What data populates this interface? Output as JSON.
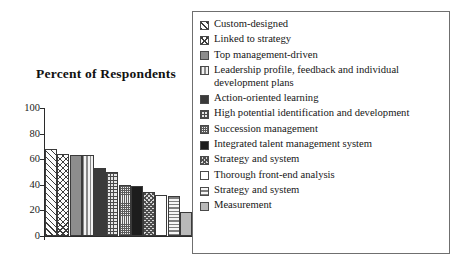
{
  "chart_data": {
    "type": "bar",
    "title": "Percent of Respondents",
    "xlabel": "",
    "ylabel": "",
    "ylim": [
      0,
      100
    ],
    "ytick_labels": [
      "100",
      "80",
      "60",
      "40",
      "20",
      "0"
    ],
    "ytick_values": [
      100,
      80,
      60,
      40,
      20,
      0
    ],
    "grid": false,
    "legend_position": "right",
    "categories": [
      "Custom-designed",
      "Linked to strategy",
      "Top management-driven",
      "Leadership profile, feedback and individual development plans",
      "Action-oriented learning",
      "High potential identification and development",
      "Succession management",
      "Integrated talent management system",
      "Strategy and system",
      "Thorough front-end analysis",
      "Strategy and system",
      "Measurement"
    ],
    "values": [
      68,
      64,
      63,
      63,
      53,
      50,
      40,
      39,
      34,
      32,
      31,
      19
    ],
    "bars": [
      {
        "label": "Custom-designed",
        "value": 68,
        "pattern": "diagonal-hatch"
      },
      {
        "label": "Linked to strategy",
        "value": 64,
        "pattern": "cross-hatch"
      },
      {
        "label": "Top management-driven",
        "value": 63,
        "pattern": "solid-gray"
      },
      {
        "label": "Leadership profile, feedback and individual development plans",
        "value": 63,
        "pattern": "vertical-stripes"
      },
      {
        "label": "Action-oriented learning",
        "value": 53,
        "pattern": "dark-solid"
      },
      {
        "label": "High potential identification and development",
        "value": 50,
        "pattern": "coarse-grid"
      },
      {
        "label": "Succession management",
        "value": 40,
        "pattern": "fine-grid"
      },
      {
        "label": "Integrated talent management system",
        "value": 39,
        "pattern": "black-solid"
      },
      {
        "label": "Strategy and system",
        "value": 34,
        "pattern": "checker"
      },
      {
        "label": "Thorough front-end analysis",
        "value": 32,
        "pattern": "white"
      },
      {
        "label": "Strategy and system",
        "value": 31,
        "pattern": "horizontal-stripes"
      },
      {
        "label": "Measurement",
        "value": 19,
        "pattern": "light-gray"
      }
    ]
  },
  "legend": {
    "items": [
      {
        "label": "Custom-designed",
        "pattern": "diagonal-hatch"
      },
      {
        "label": "Linked to strategy",
        "pattern": "cross-hatch"
      },
      {
        "label": "Top management-driven",
        "pattern": "solid-gray"
      },
      {
        "label": "Leadership profile, feedback and individual development plans",
        "pattern": "vertical-stripes"
      },
      {
        "label": "Action-oriented learning",
        "pattern": "dark-solid"
      },
      {
        "label": "High potential identification and development",
        "pattern": "coarse-grid"
      },
      {
        "label": "Succession management",
        "pattern": "fine-grid"
      },
      {
        "label": "Integrated talent management system",
        "pattern": "black-solid"
      },
      {
        "label": "Strategy and system",
        "pattern": "checker"
      },
      {
        "label": "Thorough front-end analysis",
        "pattern": "white"
      },
      {
        "label": "Strategy and system",
        "pattern": "horizontal-stripes"
      },
      {
        "label": "Measurement",
        "pattern": "light-gray"
      }
    ]
  },
  "colors": {
    "axis": "#2b2b2b",
    "text": "#1a1a1a",
    "legend_border": "#6f6f6f",
    "background": "#ffffff"
  }
}
